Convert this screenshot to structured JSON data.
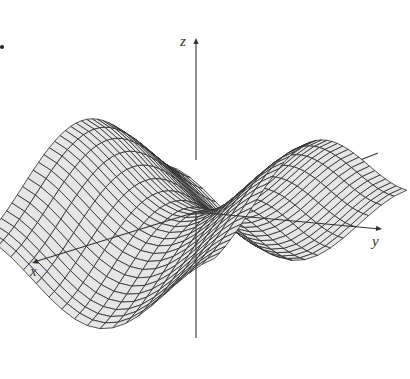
{
  "figure": {
    "axes": {
      "x": {
        "label": "x",
        "label_pos": [
          30,
          263
        ]
      },
      "y": {
        "label": "y",
        "label_pos": [
          372,
          233
        ]
      },
      "z": {
        "label": "z",
        "label_pos": [
          180,
          33
        ]
      }
    },
    "colors": {
      "mesh_line": "#2a2a2a",
      "surface_fill": "#e6e6e6",
      "axis": "#333333",
      "background": "#ffffff"
    },
    "marker_dot": [
      1,
      46
    ]
  }
}
